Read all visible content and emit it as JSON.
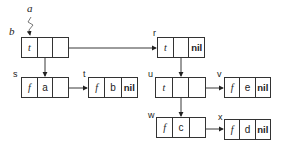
{
  "labels": {
    "a": "a",
    "b": "b"
  },
  "nodes": {
    "b": {
      "name": "",
      "tag": "t",
      "left": "",
      "right": ""
    },
    "s": {
      "name": "s",
      "tag": "f",
      "value": "a",
      "next": ""
    },
    "t": {
      "name": "t",
      "tag": "f",
      "value": "b",
      "next": "nil"
    },
    "r": {
      "name": "r",
      "tag": "t",
      "left": "",
      "right": "nil"
    },
    "u": {
      "name": "u",
      "tag": "t",
      "left": "",
      "right": ""
    },
    "v": {
      "name": "v",
      "tag": "f",
      "value": "e",
      "next": "nil"
    },
    "w": {
      "name": "w",
      "tag": "f",
      "value": "c",
      "next": ""
    },
    "x": {
      "name": "x",
      "tag": "f",
      "value": "d",
      "next": "nil"
    }
  },
  "edges": [
    {
      "from": "b.left",
      "to": "s"
    },
    {
      "from": "b.right",
      "to": "r"
    },
    {
      "from": "s.next",
      "to": "t"
    },
    {
      "from": "r.left",
      "to": "u"
    },
    {
      "from": "u.right",
      "to": "v"
    },
    {
      "from": "u.left",
      "to": "w"
    },
    {
      "from": "w.next",
      "to": "x"
    },
    {
      "from": "a",
      "to": "b"
    }
  ]
}
